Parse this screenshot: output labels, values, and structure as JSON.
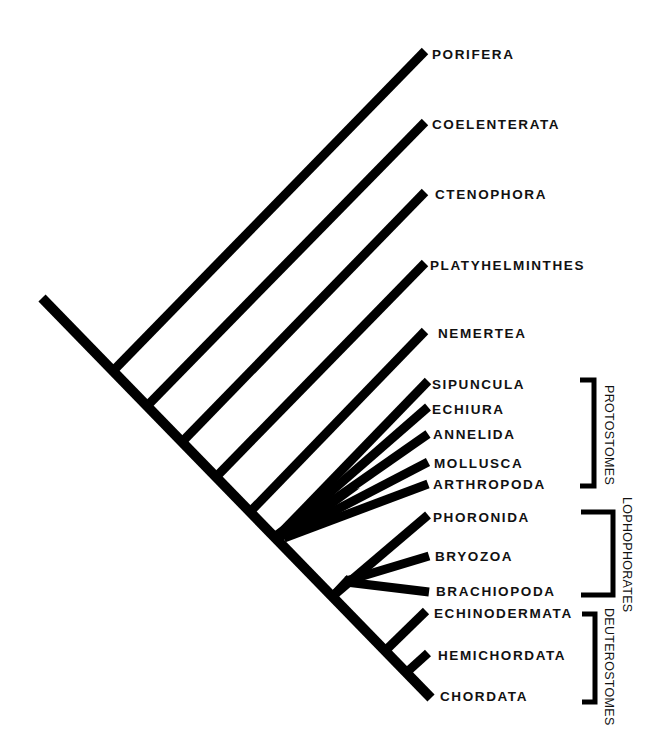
{
  "diagram": {
    "type": "phylogenetic-tree",
    "colors": {
      "line": "#000000",
      "text": "#111111",
      "background": "#ffffff"
    },
    "taxa": [
      {
        "name": "PORIFERA",
        "tip": [
          423,
          52
        ],
        "junction": [
          115,
          368
        ]
      },
      {
        "name": "COELENTERATA",
        "tip": [
          423,
          124
        ],
        "junction": [
          148,
          403
        ]
      },
      {
        "name": "CTENOPHORA",
        "tip": [
          423,
          194
        ],
        "junction": [
          183,
          440
        ]
      },
      {
        "name": "PLATYHELMINTHES",
        "tip": [
          423,
          265
        ],
        "junction": [
          217,
          473
        ]
      },
      {
        "name": "NEMERTEA",
        "tip": [
          423,
          333
        ],
        "junction": [
          251,
          508
        ]
      },
      {
        "name": "SIPUNCULA",
        "tip": [
          426,
          383
        ],
        "junction": [
          278,
          535
        ]
      },
      {
        "name": "ECHIURA",
        "tip": [
          426,
          409
        ],
        "junction": [
          278,
          535
        ]
      },
      {
        "name": "ANNELIDA",
        "tip": [
          426,
          435
        ],
        "junction": [
          278,
          535
        ]
      },
      {
        "name": "MOLLUSCA",
        "tip": [
          426,
          463
        ],
        "junction": [
          278,
          535
        ]
      },
      {
        "name": "ARTHROPODA",
        "tip": [
          426,
          484
        ],
        "junction": [
          278,
          535
        ]
      },
      {
        "name": "PHORONIDA",
        "tip": [
          426,
          516
        ],
        "junction": [
          336,
          592
        ]
      },
      {
        "name": "BRYOZOA",
        "tip": [
          428,
          557
        ],
        "junction": [
          336,
          592
        ]
      },
      {
        "name": "BRACHIOPODA",
        "tip": [
          428,
          592
        ],
        "junction": [
          336,
          592
        ]
      },
      {
        "name": "ECHINODERMATA",
        "tip": [
          424,
          612
        ],
        "junction": [
          388,
          645
        ]
      },
      {
        "name": "HEMICHORDATA",
        "tip": [
          427,
          654
        ],
        "junction": [
          410,
          668
        ]
      },
      {
        "name": "CHORDATA",
        "tip": [
          430,
          696
        ],
        "junction": [
          430,
          696
        ]
      }
    ],
    "groups": [
      {
        "name": "PROTOSTOMES",
        "bracket_top": 378,
        "bracket_bottom": 487,
        "members": [
          "SIPUNCULA",
          "ECHIURA",
          "ANNELIDA",
          "MOLLUSCA",
          "ARTHROPODA"
        ]
      },
      {
        "name": "LOPHOPHORATES",
        "bracket_top": 510,
        "bracket_bottom": 596,
        "members": [
          "PHORONIDA",
          "BRYOZOA",
          "BRACHIOPODA"
        ]
      },
      {
        "name": "DEUTEROSTOMES",
        "bracket_top": 612,
        "bracket_bottom": 703,
        "members": [
          "ECHINODERMATA",
          "HEMICHORDATA",
          "CHORDATA"
        ]
      }
    ]
  },
  "labels": {
    "porifera": "PORIFERA",
    "coelenterata": "COELENTERATA",
    "ctenophora": "CTENOPHORA",
    "platyhelminthes": "PLATYHELMINTHES",
    "nemertea": "NEMERTEA",
    "sipuncula": "SIPUNCULA",
    "echiura": "ECHIURA",
    "annelida": "ANNELIDA",
    "mollusca": "MOLLUSCA",
    "arthropoda": "ARTHROPODA",
    "phoronida": "PHORONIDA",
    "bryozoa": "BRYOZOA",
    "brachiopoda": "BRACHIOPODA",
    "echinodermata": "ECHINODERMATA",
    "hemichordata": "HEMICHORDATA",
    "chordata": "CHORDATA",
    "protostomes": "PROTOSTOMES",
    "lophophorates": "LOPHOPHORATES",
    "deuterostomes": "DEUTEROSTOMES"
  }
}
